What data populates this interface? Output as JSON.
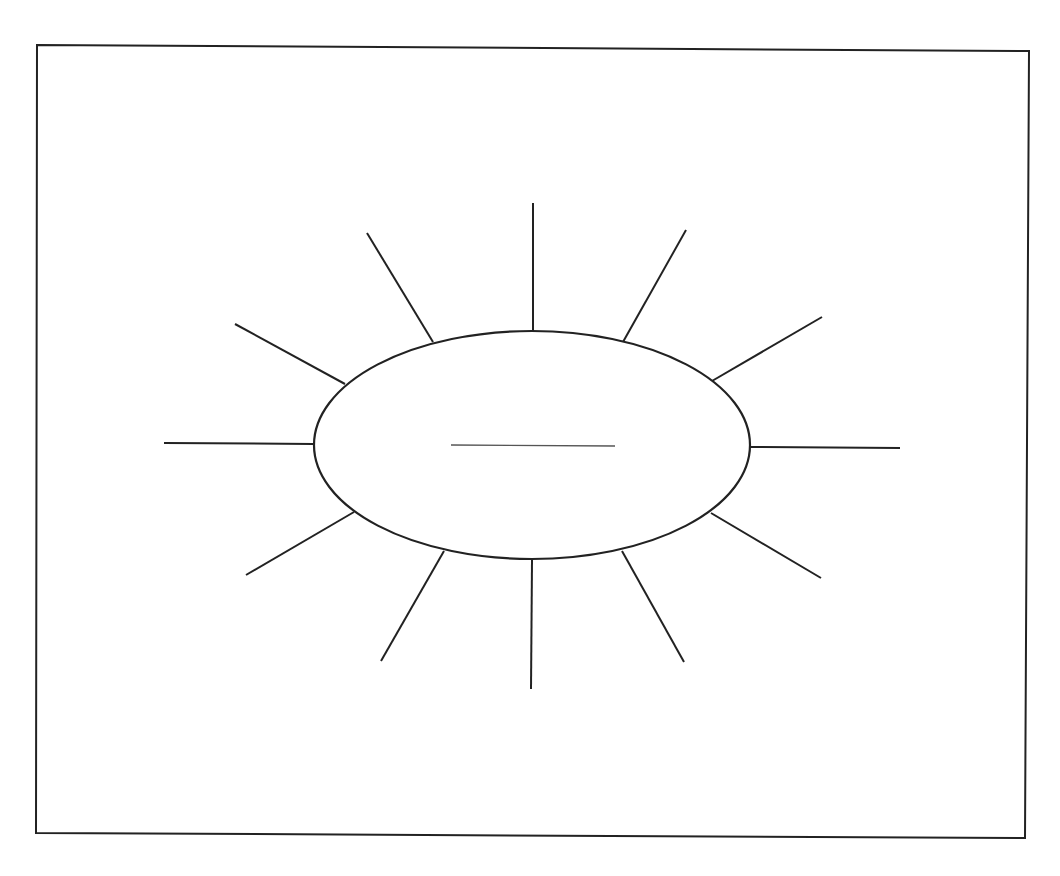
{
  "diagram": {
    "type": "sun-web-organizer",
    "colors": {
      "background": "#ffffff",
      "stroke": "#222222",
      "center_line": "#555555"
    },
    "frame": {
      "points": [
        [
          37,
          45
        ],
        [
          1029,
          51
        ],
        [
          1025,
          838
        ],
        [
          36,
          833
        ]
      ],
      "stroke_width": 2
    },
    "center_oval": {
      "cx": 532,
      "cy": 445,
      "rx": 218,
      "ry": 114,
      "stroke_width": 2.2
    },
    "center_write_line": {
      "x1": 451,
      "y1": 445,
      "x2": 615,
      "y2": 446,
      "stroke_width": 1.4
    },
    "rays": [
      {
        "id": "top",
        "x1": 533,
        "y1": 332,
        "x2": 533,
        "y2": 203
      },
      {
        "id": "top-right",
        "x1": 623,
        "y1": 342,
        "x2": 686,
        "y2": 230
      },
      {
        "id": "upper-right",
        "x1": 712,
        "y1": 381,
        "x2": 822,
        "y2": 317
      },
      {
        "id": "right",
        "x1": 750,
        "y1": 447,
        "x2": 900,
        "y2": 448
      },
      {
        "id": "lower-right",
        "x1": 711,
        "y1": 513,
        "x2": 821,
        "y2": 578
      },
      {
        "id": "bottom-right",
        "x1": 622,
        "y1": 551,
        "x2": 684,
        "y2": 662
      },
      {
        "id": "bottom",
        "x1": 532,
        "y1": 560,
        "x2": 531,
        "y2": 689
      },
      {
        "id": "bottom-left",
        "x1": 444,
        "y1": 551,
        "x2": 381,
        "y2": 661
      },
      {
        "id": "lower-left",
        "x1": 354,
        "y1": 512,
        "x2": 246,
        "y2": 575
      },
      {
        "id": "left",
        "x1": 313,
        "y1": 444,
        "x2": 164,
        "y2": 443
      },
      {
        "id": "upper-left",
        "x1": 345,
        "y1": 384,
        "x2": 235,
        "y2": 324
      },
      {
        "id": "top-left",
        "x1": 433,
        "y1": 342,
        "x2": 367,
        "y2": 233
      }
    ],
    "ray_stroke_width": 2
  }
}
